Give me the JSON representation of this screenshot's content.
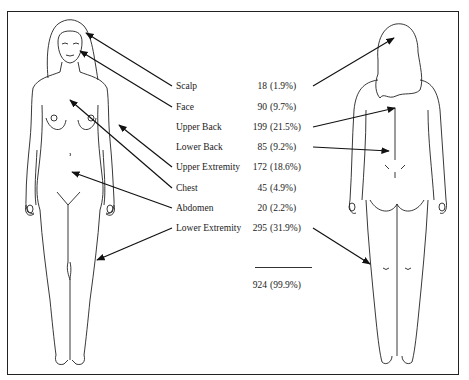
{
  "diagram": {
    "type": "body-region-distribution",
    "figures": [
      "front-view-female",
      "back-view-female"
    ],
    "rows": [
      {
        "label": "Scalp",
        "count": "18",
        "percent": "(1.9%)"
      },
      {
        "label": "Face",
        "count": "90",
        "percent": "(9.7%)"
      },
      {
        "label": "Upper Back",
        "count": "199",
        "percent": "(21.5%)"
      },
      {
        "label": "Lower Back",
        "count": "85",
        "percent": "(9.2%)"
      },
      {
        "label": "Upper Extremity",
        "count": "172",
        "percent": "(18.6%)"
      },
      {
        "label": "Chest",
        "count": "45",
        "percent": "(4.9%)"
      },
      {
        "label": "Abdomen",
        "count": "20",
        "percent": "(2.2%)"
      },
      {
        "label": "Lower Extremity",
        "count": "295",
        "percent": "(31.9%)"
      }
    ],
    "total": {
      "count": "924",
      "percent": "(99.9%)"
    },
    "colors": {
      "line": "#222222",
      "background": "#ffffff"
    }
  }
}
